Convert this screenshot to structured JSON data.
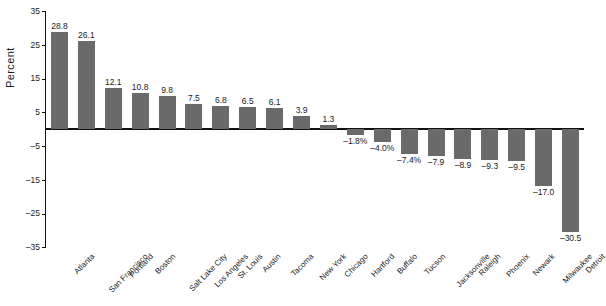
{
  "chart_data": {
    "type": "bar",
    "title": "",
    "xlabel": "",
    "ylabel": "Percent",
    "ylim": [
      -35,
      35
    ],
    "yticks": [
      35,
      25,
      15,
      5,
      -5,
      -15,
      -25,
      -35
    ],
    "ytick_labels": [
      "35",
      "25",
      "15",
      "5",
      "–5",
      "–15",
      "–25",
      "–35"
    ],
    "grid": false,
    "legend": "none",
    "bar_color": "#6a6a6a",
    "axis_color": "#111111",
    "background": "#ffffff",
    "categories": [
      "Atlanta",
      "San Francisco",
      "Portland",
      "Boston",
      "Salt Lake City",
      "Los Angeles",
      "St. Louis",
      "Austin",
      "Tacoma",
      "New York",
      "Chicago",
      "Hartford",
      "Buffalo",
      "Tucson",
      "Jacksonville",
      "Raleigh",
      "Phoenix",
      "Newark",
      "Milwaukee",
      "Detroit"
    ],
    "values": [
      28.8,
      26.1,
      12.1,
      10.8,
      9.8,
      7.5,
      6.8,
      6.5,
      6.1,
      3.9,
      1.3,
      -1.8,
      -4.0,
      -7.4,
      -7.9,
      -8.9,
      -9.3,
      -9.5,
      -17.0,
      -30.5
    ],
    "data_labels": [
      "28.8",
      "26.1",
      "12.1",
      "10.8",
      "9.8",
      "7.5",
      "6.8",
      "6.5",
      "6.1",
      "3.9",
      "1.3",
      "–1.8%",
      "–4.0%",
      "–7.4%",
      "–7.9",
      "–8.9",
      "–9.3",
      "–9.5",
      "–17.0",
      "–30.5"
    ]
  }
}
